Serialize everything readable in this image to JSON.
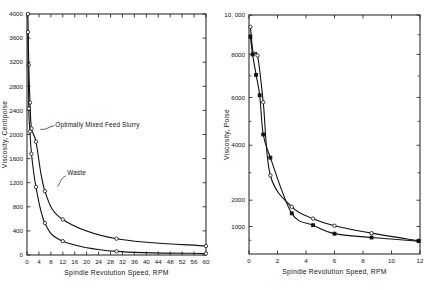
{
  "figure": {
    "background": "#ffffff",
    "ink": "#111111"
  },
  "chart_data": [
    {
      "id": "left",
      "type": "line",
      "title": "",
      "xlabel": "Spindle Revolution Speed, RPM",
      "ylabel": "Viscosity, Centipoise",
      "xlim": [
        0,
        60
      ],
      "ylim": [
        0,
        4000
      ],
      "xticks": [
        0,
        4,
        8,
        12,
        16,
        20,
        24,
        28,
        32,
        36,
        40,
        44,
        48,
        52,
        56,
        60
      ],
      "xticklabels": [
        "0",
        "4",
        "8",
        "12",
        "16",
        "20",
        "24",
        "28",
        "32",
        "36",
        "40",
        "44",
        "48",
        "52",
        "56",
        "60"
      ],
      "yticks": [
        0,
        400,
        800,
        1200,
        1600,
        2000,
        2400,
        2800,
        3200,
        3600,
        4000
      ],
      "yticklabels": [
        "0",
        "400",
        "800",
        "1200",
        "1600",
        "2000",
        "2400",
        "2800",
        "3200",
        "3600",
        "4000"
      ],
      "grid": false,
      "legend": "none",
      "annotations": [
        {
          "text": "Optimally Mixed Feed Slurry",
          "x": 9.5,
          "y": 2120
        },
        {
          "text": "Waste",
          "x": 13.5,
          "y": 1320
        }
      ],
      "series": [
        {
          "name": "Optimally Mixed Feed Slurry",
          "marker": "open-circle",
          "x": [
            0.3,
            0.6,
            1.0,
            1.5,
            3.0,
            6.0,
            12.0,
            30.0,
            60.0
          ],
          "y": [
            4000,
            3150,
            2530,
            2100,
            1880,
            1060,
            590,
            270,
            150
          ]
        },
        {
          "name": "Waste",
          "marker": "open-circle",
          "x": [
            0.3,
            0.6,
            1.0,
            1.5,
            3.0,
            6.0,
            12.0,
            30.0,
            60.0
          ],
          "y": [
            3700,
            2430,
            2050,
            1680,
            1130,
            530,
            230,
            60,
            25
          ]
        }
      ]
    },
    {
      "id": "right",
      "type": "line",
      "title": "",
      "xlabel": "Spindle Revolution Speed, RPM",
      "ylabel": "Viscosity, Poise",
      "xlim": [
        0,
        12
      ],
      "ylim": [
        0,
        10000
      ],
      "xticks": [
        0,
        2,
        4,
        6,
        8,
        10,
        12
      ],
      "xticklabels": [
        "0",
        "2",
        "4",
        "6",
        "8",
        "10",
        "12"
      ],
      "yticks": [
        1000,
        2000,
        4000,
        6000,
        8000,
        10000
      ],
      "yticklabels": [
        "1000",
        "2000",
        "4000",
        "6000",
        "8000",
        "10, 000"
      ],
      "grid": false,
      "legend": "none",
      "series": [
        {
          "name": "series-open",
          "marker": "open-circle",
          "x": [
            0.1,
            0.3,
            0.6,
            1.0,
            1.5,
            3.0,
            4.5,
            6.0,
            8.6,
            11.9
          ],
          "y": [
            9400,
            8050,
            7950,
            5800,
            2900,
            1750,
            1300,
            1030,
            760,
            480
          ]
        },
        {
          "name": "series-filled",
          "marker": "filled-square",
          "x": [
            0.1,
            0.25,
            0.5,
            0.75,
            1.0,
            1.5,
            3.0,
            4.5,
            6.0,
            8.6,
            11.9
          ],
          "y": [
            8900,
            8000,
            7050,
            6100,
            4450,
            3550,
            1500,
            1050,
            740,
            600,
            470
          ]
        }
      ]
    }
  ]
}
